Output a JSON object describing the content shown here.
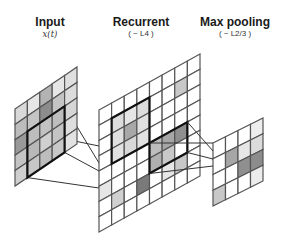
{
  "panels": [
    {
      "id": "input",
      "title": "Input",
      "subtitle": "x(t)",
      "rows": 5,
      "cols": 5,
      "shades": [
        [
          "#d9d9d9",
          "#e6e6e6",
          "#b3b3b3",
          "#e6e6e6",
          "#e0e0e0"
        ],
        [
          "#bdbdbd",
          "#c4c4c4",
          "#8c8c8c",
          "#c4c4c4",
          "#dcdcdc"
        ],
        [
          "#999999",
          "#bdbdbd",
          "#c2c2c2",
          "#bdbdbd",
          "#d6d6d6"
        ],
        [
          "#c4c4c4",
          "#b8b8b8",
          "#d0d0d0",
          "#c4c4c4",
          "#dedede"
        ],
        [
          "#cfcfcf",
          "#c6c6c6",
          "#bdbdbd",
          "#c8c8c8",
          "#e2e2e2"
        ]
      ],
      "highlight_box": {
        "row": 2,
        "col": 1,
        "rows": 3,
        "cols": 3
      }
    },
    {
      "id": "recurrent",
      "title": "Recurrent",
      "subtitle": "( ~ L4 )",
      "rows": 8,
      "cols": 8,
      "shades": [
        [
          "#ffffff",
          "#ffffff",
          "#ffffff",
          "#ffffff",
          "#ffffff",
          "#ffffff",
          "#ffffff",
          "#ffffff"
        ],
        [
          "#ffffff",
          "#dcdcdc",
          "#e6e6e6",
          "#dcdcdc",
          "#ffffff",
          "#ffffff",
          "#c8c8c8",
          "#ffffff"
        ],
        [
          "#ffffff",
          "#e0e0e0",
          "#a8a8a8",
          "#e0e0e0",
          "#ffffff",
          "#ffffff",
          "#ffffff",
          "#ffffff"
        ],
        [
          "#ffffff",
          "#e2e2e2",
          "#d8d8d8",
          "#e2e2e2",
          "#ffffff",
          "#ffffff",
          "#ffffff",
          "#ffffff"
        ],
        [
          "#ffffff",
          "#ffffff",
          "#ffffff",
          "#ffffff",
          "#bdbdbd",
          "#a6a6a6",
          "#8f8f8f",
          "#ffffff"
        ],
        [
          "#e6e6e6",
          "#ffffff",
          "#ffffff",
          "#ffffff",
          "#b0b0b0",
          "#c8c8c8",
          "#ffffff",
          "#ffffff"
        ],
        [
          "#ffffff",
          "#d0d0d0",
          "#ffffff",
          "#7a7a7a",
          "#ffffff",
          "#e6e6e6",
          "#c8c8c8",
          "#ffffff"
        ],
        [
          "#ffffff",
          "#ffffff",
          "#ffffff",
          "#ffffff",
          "#ffffff",
          "#ffffff",
          "#ffffff",
          "#ffffff"
        ]
      ],
      "highlight_box": {
        "row": 1,
        "col": 1,
        "rows": 3,
        "cols": 3
      },
      "highlight_box_2": {
        "row": 4,
        "col": 4,
        "rows": 2,
        "cols": 3
      }
    },
    {
      "id": "max-pooling",
      "title": "Max pooling",
      "subtitle": "( ~ L2/3 )",
      "rows": 4,
      "cols": 4,
      "shades": [
        [
          "#ffffff",
          "#ffffff",
          "#ffffff",
          "#eeeeee"
        ],
        [
          "#ffffff",
          "#a6a6a6",
          "#e6e6e6",
          "#dcdcdc"
        ],
        [
          "#ffffff",
          "#ffffff",
          "#8f8f8f",
          "#8c8c8c"
        ],
        [
          "#c8c8c8",
          "#ffffff",
          "#ffffff",
          "#ececec"
        ]
      ]
    }
  ],
  "colors": {
    "grid_line": "#555555",
    "box_line": "#111111",
    "connector": "#333333",
    "background": "#ffffff"
  }
}
